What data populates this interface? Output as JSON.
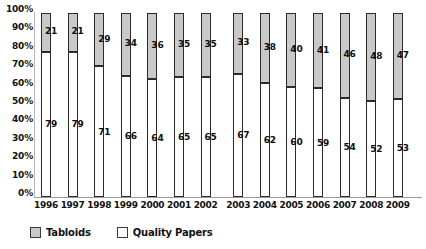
{
  "chart_data": {
    "type": "bar",
    "subtype": "100-percent-stacked-column",
    "title": "",
    "subtitle": "",
    "xlabel": "",
    "ylabel": "",
    "ylim": [
      0,
      100
    ],
    "ytick_labels": [
      "100%",
      "90%",
      "80%",
      "70%",
      "60%",
      "50%",
      "40%",
      "30%",
      "20%",
      "10%",
      "0%"
    ],
    "ytick_values": [
      100,
      90,
      80,
      70,
      60,
      50,
      40,
      30,
      20,
      10,
      0
    ],
    "grid": false,
    "legend_position": "bottom-left",
    "categories": [
      "1996",
      "1997",
      "1998",
      "1999",
      "2000",
      "2001",
      "2002",
      "2003",
      "2004",
      "2005",
      "2006",
      "2007",
      "2008",
      "2009"
    ],
    "series": [
      {
        "name": "Tabloids",
        "color": "#c9c9c9",
        "values": [
          21,
          21,
          29,
          34,
          36,
          35,
          35,
          33,
          38,
          40,
          41,
          46,
          48,
          47
        ]
      },
      {
        "name": "Quality Papers",
        "color": "#ffffff",
        "values": [
          79,
          79,
          71,
          66,
          64,
          65,
          65,
          67,
          62,
          60,
          59,
          54,
          52,
          53
        ]
      }
    ]
  },
  "legend": {
    "items": [
      {
        "label": "Tabloids",
        "color": "#c9c9c9"
      },
      {
        "label": "Quality Papers",
        "color": "#ffffff"
      }
    ]
  },
  "colors": {
    "tabloids": "#c9c9c9",
    "quality_papers": "#ffffff",
    "bar_border": "#2b2b2b",
    "axis": "#9a9a9a",
    "text": "#111111",
    "background": "#ffffff"
  }
}
